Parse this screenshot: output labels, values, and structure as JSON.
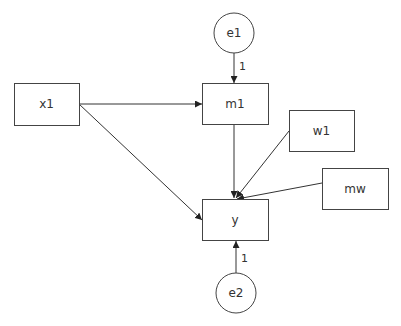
{
  "diagram": {
    "type": "path-diagram",
    "nodes": [
      {
        "id": "e1",
        "label": "e1",
        "shape": "circle"
      },
      {
        "id": "x1",
        "label": "x1",
        "shape": "rect"
      },
      {
        "id": "m1",
        "label": "m1",
        "shape": "rect"
      },
      {
        "id": "w1",
        "label": "w1",
        "shape": "rect"
      },
      {
        "id": "mw",
        "label": "mw",
        "shape": "rect"
      },
      {
        "id": "y",
        "label": "y",
        "shape": "rect"
      },
      {
        "id": "e2",
        "label": "e2",
        "shape": "circle"
      }
    ],
    "edges": [
      {
        "from": "e1",
        "to": "m1",
        "label": "1"
      },
      {
        "from": "x1",
        "to": "m1",
        "label": ""
      },
      {
        "from": "x1",
        "to": "y",
        "label": ""
      },
      {
        "from": "m1",
        "to": "y",
        "label": ""
      },
      {
        "from": "w1",
        "to": "y",
        "label": ""
      },
      {
        "from": "mw",
        "to": "y",
        "label": ""
      },
      {
        "from": "e2",
        "to": "y",
        "label": "1"
      }
    ],
    "colors": {
      "stroke": "#444444",
      "background": "#ffffff"
    }
  }
}
